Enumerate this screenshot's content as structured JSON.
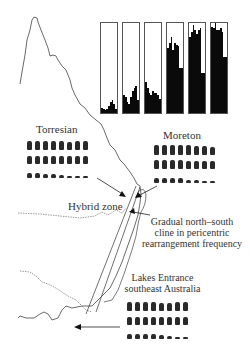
{
  "labels": {
    "torresian": "Torresian",
    "moreton": "Moreton",
    "hybrid_zone": "Hybrid zone",
    "cline_line1": "Gradual north–south",
    "cline_line2": "cline in pericentric",
    "cline_line3": "rearrangement frequency",
    "lakes_line1": "Lakes Entrance",
    "lakes_line2": "southeast Australia"
  },
  "colors": {
    "ink": "#0a0a0a",
    "panel_border": "#555555",
    "coast": "#444444",
    "background": "#ffffff"
  },
  "chart_data": {
    "type": "bar",
    "title": "",
    "xlabel": "",
    "ylabel": "",
    "grid": false,
    "ylim": [
      0,
      1
    ],
    "panels": [
      {
        "name": "panel-1",
        "values": [
          0.06,
          0.05,
          0.03,
          0.04,
          0.08,
          0.12,
          0.15,
          0.1,
          0.04
        ]
      },
      {
        "name": "panel-2",
        "values": [
          0.2,
          0.18,
          0.12,
          0.1,
          0.18,
          0.24,
          0.28,
          0.3,
          0.14
        ]
      },
      {
        "name": "panel-3",
        "values": [
          0.34,
          0.28,
          0.22,
          0.2,
          0.24,
          0.22,
          0.22,
          0.2,
          0.16
        ]
      },
      {
        "name": "panel-4",
        "values": [
          0.72,
          0.78,
          0.84,
          0.7,
          0.78,
          0.76,
          0.74,
          0.5,
          0.5
        ]
      },
      {
        "name": "panel-5",
        "values": [
          0.84,
          0.9,
          0.98,
          0.92,
          0.88,
          0.92,
          0.94,
          0.44,
          0.44
        ]
      },
      {
        "name": "panel-6",
        "values": [
          0.96,
          0.94,
          1.0,
          0.92,
          0.92,
          0.94,
          0.9,
          0.62,
          0.62
        ]
      }
    ]
  },
  "karyotypes": {
    "torresian": [
      [
        9,
        9,
        9,
        9,
        9,
        8,
        9,
        9
      ],
      [
        8,
        8,
        8,
        8,
        8,
        8,
        8,
        8
      ],
      [
        5,
        5,
        4,
        4,
        3,
        2,
        2,
        2
      ]
    ],
    "moreton": [
      [
        10,
        10,
        10,
        10,
        10,
        9,
        9,
        8
      ],
      [
        9,
        9,
        9,
        9,
        8,
        8,
        8,
        8
      ],
      [
        5,
        5,
        5,
        5,
        3,
        3,
        2,
        2
      ]
    ],
    "lakes": [
      [
        9,
        9,
        9,
        9,
        8,
        8,
        9,
        9
      ],
      [
        8,
        8,
        8,
        8,
        8,
        8,
        8,
        8
      ],
      [
        5,
        5,
        5,
        5,
        4,
        3,
        2,
        2
      ]
    ]
  }
}
